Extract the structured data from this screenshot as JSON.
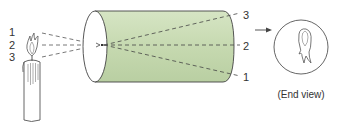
{
  "diagram": {
    "type": "pinhole-camera",
    "colors": {
      "cylinder_fill": "#c9dcb4",
      "cylinder_fill_light": "#dfead2",
      "stroke": "#444444",
      "text": "#333333"
    },
    "source_labels": [
      "1",
      "2",
      "3"
    ],
    "image_labels": [
      "3",
      "2",
      "1"
    ],
    "end_view_caption": "(End view)",
    "icons": {
      "candle": "candle-icon",
      "flame": "flame-icon",
      "inverted_flame": "inverted-flame-icon",
      "arrow": "arrow-right-icon"
    }
  }
}
